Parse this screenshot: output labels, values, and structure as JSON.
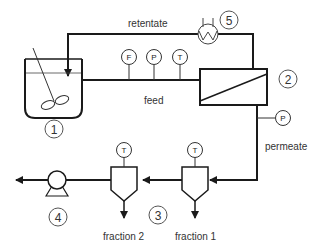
{
  "diagram": {
    "labels": {
      "retentate": "retentate",
      "feed": "feed",
      "permeate": "permeate",
      "fraction1": "fraction 1",
      "fraction2": "fraction 2"
    },
    "units": {
      "tank": "1",
      "membrane": "2",
      "separators": "3",
      "pump": "4",
      "heat_exchanger": "5"
    },
    "instruments": {
      "feed_flow": "F",
      "feed_pressure": "P",
      "feed_temp": "T",
      "permeate_pressure": "P",
      "sep1_temp": "T",
      "sep2_temp": "T"
    },
    "colors": {
      "line": "#1a1a1a",
      "text": "#333333",
      "bg": "#ffffff"
    }
  }
}
